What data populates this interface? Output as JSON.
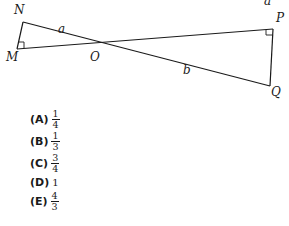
{
  "figure": {
    "points": {
      "N": "N",
      "M": "M",
      "O": "O",
      "P": "P",
      "Q": "Q"
    },
    "segments": {
      "a": "a",
      "b": "b"
    },
    "clipped_top_label": "a",
    "right_angle_marks": [
      "M",
      "P"
    ]
  },
  "choices": [
    {
      "letter": "(A)",
      "num": "1",
      "den": "4"
    },
    {
      "letter": "(B)",
      "num": "1",
      "den": "3"
    },
    {
      "letter": "(C)",
      "num": "3",
      "den": "4"
    },
    {
      "letter": "(D)",
      "value": "1"
    },
    {
      "letter": "(E)",
      "num": "4",
      "den": "3"
    }
  ]
}
